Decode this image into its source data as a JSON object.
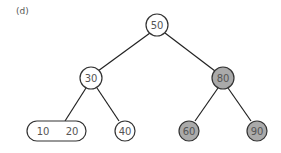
{
  "figure": {
    "label": "(d)"
  },
  "colors": {
    "edge": "#222222",
    "node_fill_default": "#ffffff",
    "node_fill_highlight": "#aaaaaa",
    "node_stroke": "#333333",
    "text": "#555555"
  },
  "tree": {
    "nodes": [
      {
        "id": "n50",
        "keys": [
          "50"
        ],
        "highlighted": false,
        "shape": "circle",
        "cx": 157,
        "cy": 25
      },
      {
        "id": "n30",
        "keys": [
          "30"
        ],
        "highlighted": false,
        "shape": "circle",
        "cx": 91,
        "cy": 78
      },
      {
        "id": "n80",
        "keys": [
          "80"
        ],
        "highlighted": true,
        "shape": "circle",
        "cx": 223,
        "cy": 78
      },
      {
        "id": "n10_20",
        "keys": [
          "10",
          "20"
        ],
        "highlighted": false,
        "shape": "oval",
        "cx": 57,
        "cy": 131
      },
      {
        "id": "n40",
        "keys": [
          "40"
        ],
        "highlighted": false,
        "shape": "circle",
        "cx": 125,
        "cy": 131
      },
      {
        "id": "n60",
        "keys": [
          "60"
        ],
        "highlighted": true,
        "shape": "circle",
        "cx": 189,
        "cy": 131
      },
      {
        "id": "n90",
        "keys": [
          "90"
        ],
        "highlighted": true,
        "shape": "circle",
        "cx": 257,
        "cy": 131
      }
    ],
    "edges": [
      [
        "50",
        "30"
      ],
      [
        "50",
        "80"
      ],
      [
        "30",
        "10 20"
      ],
      [
        "30",
        "40"
      ],
      [
        "80",
        "60"
      ],
      [
        "80",
        "90"
      ]
    ]
  }
}
